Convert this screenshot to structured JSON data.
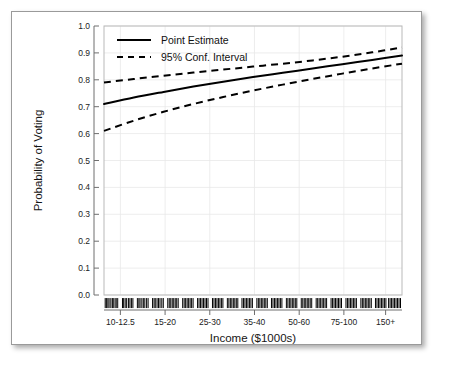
{
  "figure": {
    "background_color": "#ffffff",
    "frame_color": "#9a9a9a"
  },
  "chart_data": {
    "type": "line",
    "title": "",
    "subtitle": "",
    "xlabel": "Income ($1000s)",
    "ylabel": "Probability of Voting",
    "grid": true,
    "legend_position": "top-left",
    "xlim": [
      0,
      1
    ],
    "ylim": [
      0.0,
      1.0
    ],
    "ytick_labels": [
      "0.0",
      "0.1",
      "0.2",
      "0.3",
      "0.4",
      "0.5",
      "0.6",
      "0.7",
      "0.8",
      "0.9",
      "1.0"
    ],
    "ytick_values": [
      0.0,
      0.1,
      0.2,
      0.3,
      0.4,
      0.5,
      0.6,
      0.7,
      0.8,
      0.9,
      1.0
    ],
    "xtick_labels": [
      "10-12.5",
      "15-20",
      "25-30",
      "35-40",
      "50-60",
      "75-100",
      "150+"
    ],
    "xtick_positions": [
      0.055,
      0.205,
      0.355,
      0.505,
      0.655,
      0.805,
      0.945
    ],
    "x": [
      0.0,
      0.1,
      0.2,
      0.3,
      0.4,
      0.5,
      0.6,
      0.7,
      0.8,
      0.9,
      1.0
    ],
    "series": [
      {
        "name": "Point Estimate",
        "style": "solid",
        "color": "#000000",
        "values": [
          0.71,
          0.734,
          0.755,
          0.775,
          0.793,
          0.81,
          0.826,
          0.842,
          0.858,
          0.874,
          0.89
        ]
      },
      {
        "name": "95% Conf. Interval Upper",
        "style": "dashed",
        "color": "#000000",
        "values": [
          0.79,
          0.803,
          0.815,
          0.827,
          0.838,
          0.849,
          0.86,
          0.872,
          0.886,
          0.902,
          0.92
        ]
      },
      {
        "name": "95% Conf. Interval Lower",
        "style": "dashed",
        "color": "#000000",
        "values": [
          0.61,
          0.648,
          0.681,
          0.71,
          0.736,
          0.76,
          0.782,
          0.803,
          0.823,
          0.842,
          0.86
        ]
      }
    ],
    "rug": {
      "label": "data rug marks",
      "y_value": -0.03,
      "positions": [
        0.004,
        0.008,
        0.013,
        0.017,
        0.023,
        0.028,
        0.031,
        0.037,
        0.041,
        0.046,
        0.062,
        0.066,
        0.071,
        0.076,
        0.082,
        0.087,
        0.092,
        0.097,
        0.112,
        0.117,
        0.121,
        0.127,
        0.132,
        0.137,
        0.143,
        0.148,
        0.163,
        0.168,
        0.172,
        0.178,
        0.183,
        0.188,
        0.194,
        0.199,
        0.214,
        0.219,
        0.224,
        0.229,
        0.234,
        0.239,
        0.244,
        0.249,
        0.264,
        0.269,
        0.274,
        0.279,
        0.284,
        0.289,
        0.294,
        0.299,
        0.314,
        0.319,
        0.324,
        0.329,
        0.334,
        0.339,
        0.344,
        0.349,
        0.364,
        0.369,
        0.374,
        0.379,
        0.384,
        0.389,
        0.394,
        0.399,
        0.414,
        0.419,
        0.424,
        0.429,
        0.434,
        0.439,
        0.444,
        0.449,
        0.463,
        0.468,
        0.473,
        0.478,
        0.483,
        0.488,
        0.493,
        0.498,
        0.513,
        0.518,
        0.523,
        0.528,
        0.533,
        0.538,
        0.543,
        0.548,
        0.562,
        0.567,
        0.572,
        0.577,
        0.582,
        0.587,
        0.592,
        0.597,
        0.612,
        0.617,
        0.622,
        0.627,
        0.632,
        0.637,
        0.642,
        0.647,
        0.662,
        0.667,
        0.672,
        0.677,
        0.682,
        0.687,
        0.692,
        0.697,
        0.712,
        0.717,
        0.722,
        0.727,
        0.732,
        0.737,
        0.742,
        0.747,
        0.762,
        0.767,
        0.772,
        0.777,
        0.782,
        0.787,
        0.792,
        0.797,
        0.812,
        0.817,
        0.822,
        0.827,
        0.832,
        0.837,
        0.842,
        0.847,
        0.862,
        0.867,
        0.872,
        0.877,
        0.882,
        0.887,
        0.892,
        0.897,
        0.911,
        0.916,
        0.921,
        0.926,
        0.931,
        0.936,
        0.941,
        0.946,
        0.955,
        0.96,
        0.965,
        0.97,
        0.975,
        0.98,
        0.985,
        0.99,
        0.995
      ]
    }
  },
  "legend": {
    "items": [
      {
        "label": "Point Estimate",
        "style": "solid"
      },
      {
        "label": "95% Conf. Interval",
        "style": "dashed"
      }
    ]
  }
}
